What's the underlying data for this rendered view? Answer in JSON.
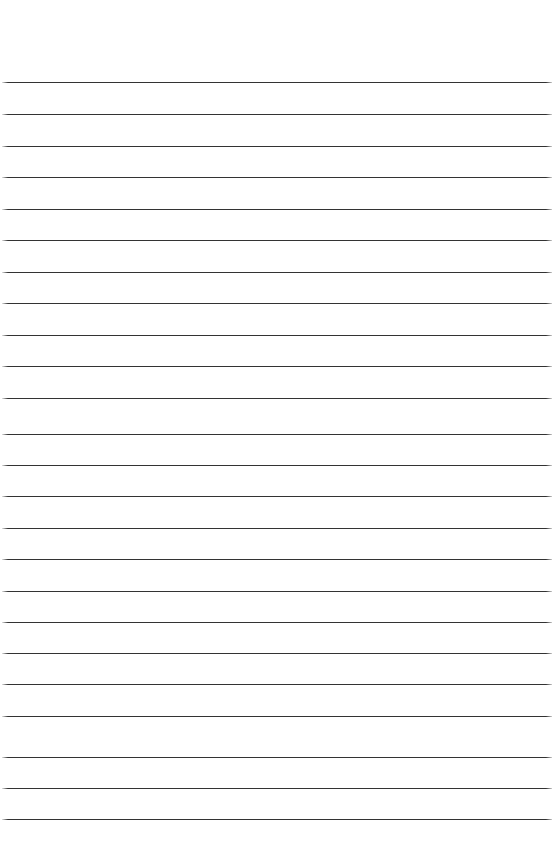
{
  "page": {
    "kind": "ruled-notebook-page",
    "width": 555,
    "height": 843,
    "background_color": "#ffffff",
    "has_text_content": false,
    "has_margin_rule": false,
    "has_header": false,
    "has_footer": false,
    "top_margin_height": 82,
    "caption": ""
  },
  "rules": {
    "count": 24,
    "color": "#333333",
    "thickness_px": 1,
    "spacing_px": 32,
    "first_line_y": 82,
    "last_line_y": 819,
    "left_x": 2,
    "right_x": 552,
    "length_px": 550,
    "lines": [
      {
        "index": 1,
        "y": 82,
        "left": 2,
        "width": 550
      },
      {
        "index": 2,
        "y": 114,
        "left": 2,
        "width": 550
      },
      {
        "index": 3,
        "y": 146,
        "left": 2,
        "width": 550
      },
      {
        "index": 4,
        "y": 177,
        "left": 2,
        "width": 550
      },
      {
        "index": 5,
        "y": 209,
        "left": 2,
        "width": 550
      },
      {
        "index": 6,
        "y": 240,
        "left": 2,
        "width": 550
      },
      {
        "index": 7,
        "y": 272,
        "left": 2,
        "width": 550
      },
      {
        "index": 8,
        "y": 303,
        "left": 2,
        "width": 550
      },
      {
        "index": 9,
        "y": 335,
        "left": 2,
        "width": 550
      },
      {
        "index": 10,
        "y": 366,
        "left": 2,
        "width": 550
      },
      {
        "index": 11,
        "y": 398,
        "left": 2,
        "width": 550
      },
      {
        "index": 12,
        "y": 434,
        "left": 2,
        "width": 550
      },
      {
        "index": 13,
        "y": 465,
        "left": 2,
        "width": 550
      },
      {
        "index": 14,
        "y": 496,
        "left": 2,
        "width": 550
      },
      {
        "index": 15,
        "y": 528,
        "left": 2,
        "width": 550
      },
      {
        "index": 16,
        "y": 559,
        "left": 2,
        "width": 550
      },
      {
        "index": 17,
        "y": 591,
        "left": 2,
        "width": 550
      },
      {
        "index": 18,
        "y": 622,
        "left": 2,
        "width": 550
      },
      {
        "index": 19,
        "y": 653,
        "left": 2,
        "width": 550
      },
      {
        "index": 20,
        "y": 684,
        "left": 2,
        "width": 550
      },
      {
        "index": 21,
        "y": 716,
        "left": 2,
        "width": 550
      },
      {
        "index": 22,
        "y": 757,
        "left": 2,
        "width": 550
      },
      {
        "index": 23,
        "y": 788,
        "left": 2,
        "width": 550
      },
      {
        "index": 24,
        "y": 819,
        "left": 2,
        "width": 550
      }
    ]
  }
}
